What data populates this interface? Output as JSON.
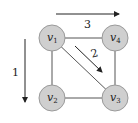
{
  "diagram": {
    "colors": {
      "node_fill": "#cfcfcf",
      "node_stroke": "#9a9a9a",
      "edge": "#555555",
      "arrow": "#222222"
    },
    "nodes": [
      {
        "id": "v1",
        "base": "v",
        "sub": "1",
        "cx": 52,
        "cy": 38
      },
      {
        "id": "v4",
        "base": "v",
        "sub": "4",
        "cx": 115,
        "cy": 38
      },
      {
        "id": "v2",
        "base": "v",
        "sub": "2",
        "cx": 52,
        "cy": 98
      },
      {
        "id": "v3",
        "base": "v",
        "sub": "3",
        "cx": 115,
        "cy": 98
      }
    ],
    "edges": [
      {
        "from": "v1",
        "to": "v4"
      },
      {
        "from": "v1",
        "to": "v2"
      },
      {
        "from": "v1",
        "to": "v3"
      },
      {
        "from": "v4",
        "to": "v3"
      },
      {
        "from": "v2",
        "to": "v3"
      }
    ],
    "arrows": [
      {
        "id": "arrow-1",
        "label": "1",
        "direction": "down"
      },
      {
        "id": "arrow-2",
        "label": "2",
        "direction": "diagonal-down-right"
      },
      {
        "id": "arrow-3",
        "label": "3",
        "direction": "right"
      }
    ]
  }
}
